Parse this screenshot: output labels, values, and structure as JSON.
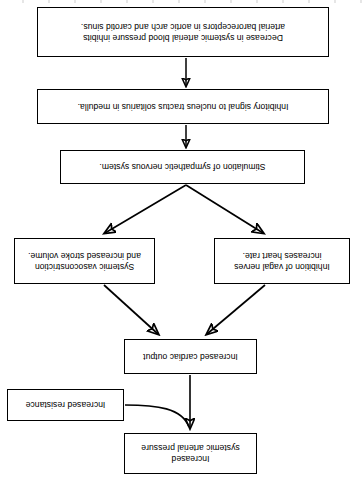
{
  "diagram": {
    "orientation": "rotated-180",
    "colors": {
      "background": "#ffffff",
      "box_border": "#000000",
      "text": "#000000",
      "arrow": "#000000"
    },
    "nodes": [
      {
        "id": "baroreceptors",
        "lines": [
          "Decrease in systemic arterial blood pressure inhibits",
          "arterial baroreceptors in aortic arch and carotid sinus."
        ],
        "text": "Decrease in systemic arterial blood pressure inhibits arterial baroreceptors in aortic arch and carotid sinus."
      },
      {
        "id": "inhibitory",
        "lines": [
          "Inhibitory signal to nucleus tractus solitarius in medulla."
        ],
        "text": "Inhibitory signal to nucleus tractus solitarius in medulla."
      },
      {
        "id": "sympathetic",
        "lines": [
          "Stimulation of sympathetic nervous system."
        ],
        "text": "Stimulation of sympathetic nervous system."
      },
      {
        "id": "vagal",
        "lines": [
          "Inhibition of vagal nerves",
          "increases heart rate."
        ],
        "text": "Inhibition of vagal nerves increases heart rate."
      },
      {
        "id": "vasoconstriction",
        "lines": [
          "Systemic vasoconstriction",
          "and increased stroke volume."
        ],
        "text": "Systemic vasoconstriction and increased stroke volume."
      },
      {
        "id": "cardiac_output",
        "lines": [
          "Increased cardiac output"
        ],
        "text": "Increased cardiac output"
      },
      {
        "id": "resistance",
        "lines": [
          "Increased resistance"
        ],
        "text": "Increased resistance"
      },
      {
        "id": "pressure",
        "lines": [
          "Increased",
          "systemic arterial pressure"
        ],
        "text": "Increased systemic arterial pressure"
      }
    ],
    "edges": [
      {
        "id": "e1",
        "from": "baroreceptors",
        "to": "inhibitory",
        "style": "straight-up"
      },
      {
        "id": "e2",
        "from": "inhibitory",
        "to": "sympathetic",
        "style": "straight-up"
      },
      {
        "id": "e3",
        "from": "sympathetic",
        "to": "vagal",
        "style": "diagonal-up-left"
      },
      {
        "id": "e4",
        "from": "sympathetic",
        "to": "vasoconstriction",
        "style": "diagonal-up-right"
      },
      {
        "id": "e5",
        "from": "vagal",
        "to": "cardiac_output",
        "style": "diagonal-up-right"
      },
      {
        "id": "e6",
        "from": "vasoconstriction",
        "to": "cardiac_output",
        "style": "diagonal-up-left"
      },
      {
        "id": "e7",
        "from": "cardiac_output",
        "to": "pressure",
        "style": "straight-up"
      },
      {
        "id": "e8",
        "from": "resistance",
        "to": "pressure",
        "style": "curved"
      }
    ]
  }
}
